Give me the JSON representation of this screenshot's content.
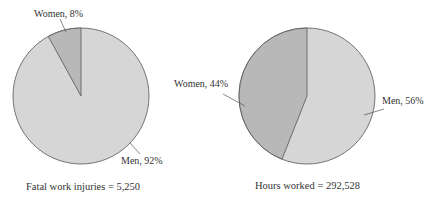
{
  "chart_data": [
    {
      "type": "pie",
      "title": "",
      "caption": "Fatal work injuries = 5,250",
      "categories": [
        "Women",
        "Men"
      ],
      "values": [
        8,
        92
      ],
      "labels": [
        "Women, 8%",
        "Men, 92%"
      ],
      "colors": [
        "#b8b8b8",
        "#d6d6d6"
      ],
      "total_label": "Fatal work injuries",
      "total_value": "5,250"
    },
    {
      "type": "pie",
      "title": "",
      "caption": "Hours worked = 292,528",
      "categories": [
        "Women",
        "Men"
      ],
      "values": [
        44,
        56
      ],
      "labels": [
        "Women, 44%",
        "Men, 56%"
      ],
      "colors": [
        "#b8b8b8",
        "#d6d6d6"
      ],
      "total_label": "Hours worked",
      "total_value": "292,528"
    }
  ]
}
